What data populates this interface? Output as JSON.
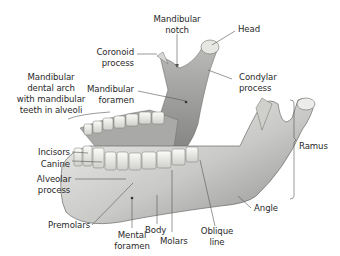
{
  "figure": {
    "labels": {
      "mandibular_notch": [
        "Mandibular",
        "notch"
      ],
      "head": [
        "Head"
      ],
      "coronoid_process": [
        "Coronoid",
        "process"
      ],
      "condylar_process": [
        "Condylar",
        "process"
      ],
      "mandibular_dental_arch": [
        "Mandibular",
        "dental arch",
        "with mandibular",
        "teeth in alveoli"
      ],
      "mandibular_foramen": [
        "Mandibular",
        "foramen"
      ],
      "ramus": [
        "Ramus"
      ],
      "incisors": [
        "Incisors"
      ],
      "canine": [
        "Canine"
      ],
      "alveolar_process": [
        "Alveolar",
        "process"
      ],
      "angle": [
        "Angle"
      ],
      "premolars": [
        "Premolars"
      ],
      "mental_foramen": [
        "Mental",
        "foramen"
      ],
      "body": [
        "Body"
      ],
      "molars": [
        "Molars"
      ],
      "oblique_line": [
        "Oblique",
        "line"
      ]
    },
    "colors": {
      "bone_light": "#e8e8e6",
      "bone_mid": "#bdbdbb",
      "bone_dark": "#7d7d7b",
      "leader": "#555555",
      "text": "#2a2a2a"
    }
  }
}
